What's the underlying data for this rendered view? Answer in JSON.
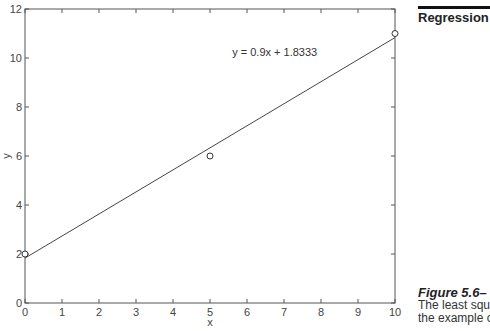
{
  "header": {
    "section_title": "Regression"
  },
  "caption": {
    "figure_label": "Figure 5.6–",
    "lines": [
      "The least squ",
      "the example c"
    ]
  },
  "chart_data": {
    "type": "scatter",
    "title": "",
    "xlabel": "x",
    "ylabel": "y",
    "xlim": [
      0,
      10
    ],
    "ylim": [
      0,
      12
    ],
    "grid": false,
    "x_ticks": [
      0,
      1,
      2,
      3,
      4,
      5,
      6,
      7,
      8,
      9,
      10
    ],
    "y_ticks": [
      0,
      2,
      4,
      6,
      8,
      10,
      12
    ],
    "series": [
      {
        "name": "data",
        "marker": "circle-open",
        "x": [
          0,
          5,
          10
        ],
        "y": [
          2,
          6,
          11
        ]
      },
      {
        "name": "fit",
        "type": "line",
        "x": [
          0,
          10
        ],
        "y": [
          1.8333,
          10.8333
        ],
        "slope": 0.9,
        "intercept": 1.8333
      }
    ],
    "annotations": [
      {
        "text": "y = 0.9x + 1.8333",
        "x": 5.6,
        "y": 10.1
      }
    ],
    "colors": {
      "axis": "#555555",
      "line": "#444444",
      "marker": "#333333"
    }
  }
}
